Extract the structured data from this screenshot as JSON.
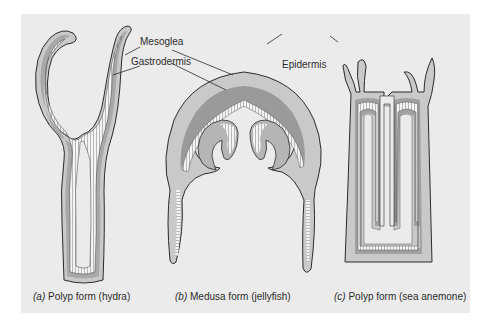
{
  "figure": {
    "background_color": "#ebebeb",
    "colors": {
      "epidermis": "#c9c9c9",
      "mesoglea": "#9e9e9e",
      "gastrodermis": "#f2f2f2",
      "outline": "#2b2b2b"
    },
    "labels": {
      "mesoglea": "Mesoglea",
      "gastrodermis": "Gastrodermis",
      "epidermis": "Epidermis"
    },
    "panels": [
      {
        "letter": "(a)",
        "caption": "Polyp form (hydra)"
      },
      {
        "letter": "(b)",
        "caption": "Medusa form (jellyfish)"
      },
      {
        "letter": "(c)",
        "caption": "Polyp form (sea anemone)"
      }
    ]
  }
}
